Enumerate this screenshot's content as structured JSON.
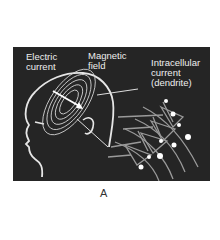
{
  "figure": {
    "labels": {
      "electric_current": "Electric\ncurrent",
      "magnetic_field": "Magnetic\nfield",
      "intracellular_current": "Intracellular\ncurrent\n(dendrite)"
    },
    "caption": "A"
  },
  "colors": {
    "background": "#252525",
    "line": "#e6e6e6",
    "neuron": "#9a9a9a"
  }
}
